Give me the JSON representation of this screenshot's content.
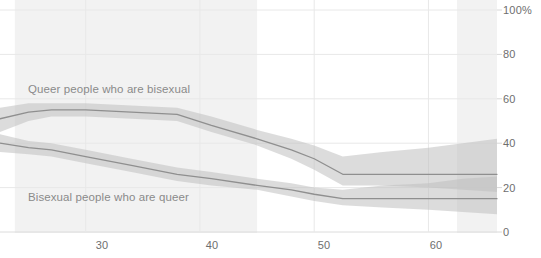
{
  "chart_data": {
    "type": "line",
    "title": "",
    "xlabel": "",
    "ylabel": "",
    "xlim": [
      22.5,
      66
    ],
    "ylim": [
      0,
      100
    ],
    "grid": true,
    "legend_position": "inline-annotation",
    "y_ticks": [
      0,
      20,
      40,
      60,
      80,
      100
    ],
    "y_tick_labels": [
      "0",
      "20",
      "40",
      "60",
      "80",
      "100%"
    ],
    "x_ticks": [
      30,
      40,
      50,
      60
    ],
    "x_tick_labels": [
      "30",
      "40",
      "50",
      "60"
    ],
    "shaded_x_bands": [
      {
        "from": 23.8,
        "to": 45.0,
        "color": "#f2f2f2"
      },
      {
        "from": 62.5,
        "to": 66.0,
        "color": "#f2f2f2"
      }
    ],
    "series": [
      {
        "name": "Queer people who are bisexual",
        "color": "#8f8f8f",
        "band_color": "#bfbfbf",
        "label_x": 30,
        "label_y": 66,
        "x": [
          22.5,
          25,
          27,
          30,
          34,
          38,
          41,
          45,
          48,
          50,
          52.5,
          56,
          60,
          63,
          66
        ],
        "values": [
          51,
          54,
          55,
          55,
          54,
          53,
          48,
          42,
          37,
          33,
          26,
          26,
          26,
          26,
          26
        ],
        "lower": [
          45,
          50,
          52,
          52,
          51,
          50,
          45,
          39,
          33,
          28,
          21,
          21,
          20,
          19,
          18
        ],
        "upper": [
          56,
          58,
          58,
          58,
          57,
          56,
          52,
          46,
          42,
          39,
          34,
          36,
          38,
          40,
          42
        ]
      },
      {
        "name": "Bisexual people who are queer",
        "color": "#8f8f8f",
        "band_color": "#bfbfbf",
        "label_x": 30,
        "label_y": 20,
        "x": [
          22.5,
          25,
          27,
          30,
          34,
          38,
          41,
          45,
          48,
          50,
          52.5,
          56,
          60,
          63,
          66
        ],
        "values": [
          40,
          38,
          37,
          34,
          30,
          26,
          24,
          21,
          19,
          17,
          15,
          15,
          15,
          15,
          15
        ],
        "lower": [
          36,
          35,
          34,
          31,
          27,
          23,
          21,
          19,
          16,
          14,
          12,
          11,
          10,
          9,
          8
        ],
        "upper": [
          44,
          41,
          40,
          37,
          33,
          29,
          27,
          24,
          22,
          20,
          19,
          21,
          22,
          24,
          25
        ]
      }
    ],
    "annotations": [
      {
        "text": "Queer people who are bisexual",
        "x": 30,
        "y": 66
      },
      {
        "text": "Bisexual people who are queer",
        "x": 30,
        "y": 20
      }
    ]
  },
  "axis": {
    "y_labels": [
      "100%",
      "80",
      "60",
      "40",
      "20",
      "0"
    ],
    "x_labels": [
      "30",
      "40",
      "50",
      "60"
    ]
  },
  "labels": {
    "series_top": "Queer people who are bisexual",
    "series_bottom": "Bisexual people who are queer"
  },
  "colors": {
    "background": "#ffffff",
    "shade": "#f2f2f2",
    "gridline": "#e8e8e8",
    "band": "#bfbfbf",
    "line": "#8f8f8f",
    "tick_text": "#6e6e6e",
    "label_text": "#8a8a8a"
  }
}
